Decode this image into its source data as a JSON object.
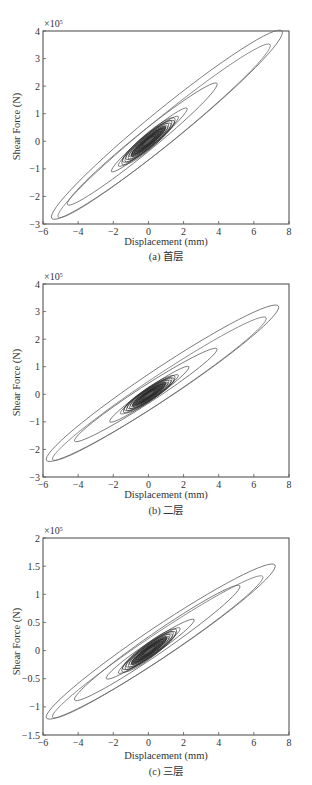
{
  "figure": {
    "panels": [
      {
        "caption": "(a) 首层",
        "xlabel": "Displacement (mm)",
        "ylabel": "Shear Force (N)",
        "multiplier": "×10",
        "multiplier_exp": "5"
      },
      {
        "caption": "(b) 二层",
        "xlabel": "Displacement (mm)",
        "ylabel": "Shear Force (N)",
        "multiplier": "×10",
        "multiplier_exp": "5"
      },
      {
        "caption": "(c) 三层",
        "xlabel": "Displacement (mm)",
        "ylabel": "Shear Force (N)",
        "multiplier": "×10",
        "multiplier_exp": "5"
      }
    ],
    "colors": {
      "axis": "#555555",
      "curve": "#6a6a6a",
      "core": "#222222"
    }
  },
  "chart_data": [
    {
      "type": "line",
      "title": "(a) 首层",
      "xlabel": "Displacement (mm)",
      "ylabel": "Shear Force (N)",
      "y_multiplier": "1e5",
      "xlim": [
        -6,
        8
      ],
      "ylim": [
        -3,
        4
      ],
      "xticks": [
        -6,
        -4,
        -2,
        0,
        2,
        4,
        6,
        8
      ],
      "yticks": [
        -3,
        -2,
        -1,
        0,
        1,
        2,
        3,
        4
      ],
      "grid": false,
      "description": "Hysteresis loops of shear force vs displacement; dense core around origin",
      "loops": [
        {
          "x_range": [
            -5.5,
            7.6
          ],
          "y_range": [
            -2.8,
            4.0
          ]
        },
        {
          "x_range": [
            -4.6,
            3.9
          ],
          "y_range": [
            -2.3,
            2.1
          ]
        },
        {
          "x_range": [
            -2.1,
            2.2
          ],
          "y_range": [
            -1.1,
            1.2
          ]
        },
        {
          "x_range": [
            -1.7,
            1.7
          ],
          "y_range": [
            -0.9,
            0.9
          ]
        }
      ],
      "peak": {
        "x": 7.6,
        "y": 4.0
      },
      "trough": {
        "x": -5.5,
        "y": -2.8
      }
    },
    {
      "type": "line",
      "title": "(b) 二层",
      "xlabel": "Displacement (mm)",
      "ylabel": "Shear Force (N)",
      "y_multiplier": "1e5",
      "xlim": [
        -6,
        8
      ],
      "ylim": [
        -3,
        4
      ],
      "xticks": [
        -6,
        -4,
        -2,
        0,
        2,
        4,
        6,
        8
      ],
      "yticks": [
        -3,
        -2,
        -1,
        0,
        1,
        2,
        3,
        4
      ],
      "grid": false,
      "loops": [
        {
          "x_range": [
            -5.8,
            7.4
          ],
          "y_range": [
            -2.4,
            3.2
          ]
        },
        {
          "x_range": [
            -4.2,
            3.9
          ],
          "y_range": [
            -1.7,
            1.65
          ]
        },
        {
          "x_range": [
            -2.2,
            2.3
          ],
          "y_range": [
            -1.0,
            1.0
          ]
        },
        {
          "x_range": [
            -1.6,
            1.7
          ],
          "y_range": [
            -0.7,
            0.7
          ]
        }
      ],
      "peak": {
        "x": 7.2,
        "y": 3.2
      },
      "trough": {
        "x": -5.6,
        "y": -2.4
      }
    },
    {
      "type": "line",
      "title": "(c) 三层",
      "xlabel": "Displacement (mm)",
      "ylabel": "Shear Force (N)",
      "y_multiplier": "1e5",
      "xlim": [
        -6,
        8
      ],
      "ylim": [
        -1.5,
        2
      ],
      "xticks": [
        -6,
        -4,
        -2,
        0,
        2,
        4,
        6,
        8
      ],
      "yticks": [
        -1.5,
        -1,
        -0.5,
        0,
        0.5,
        1,
        1.5,
        2
      ],
      "grid": false,
      "loops": [
        {
          "x_range": [
            -5.8,
            7.2
          ],
          "y_range": [
            -1.2,
            1.52
          ]
        },
        {
          "x_range": [
            -4.2,
            5.2
          ],
          "y_range": [
            -0.88,
            1.15
          ]
        },
        {
          "x_range": [
            -2.4,
            2.6
          ],
          "y_range": [
            -0.5,
            0.55
          ]
        },
        {
          "x_range": [
            -1.7,
            1.8
          ],
          "y_range": [
            -0.4,
            0.4
          ]
        }
      ],
      "peak": {
        "x": 7.0,
        "y": 1.52
      },
      "trough": {
        "x": -5.5,
        "y": -1.18
      }
    }
  ]
}
